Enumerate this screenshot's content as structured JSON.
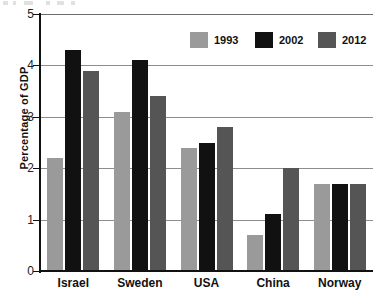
{
  "chart_data": {
    "type": "bar",
    "title": "",
    "subtitle": "",
    "xlabel": "",
    "ylabel": "Percentage of GDP",
    "categories": [
      "Israel",
      "Sweden",
      "USA",
      "China",
      "Norway"
    ],
    "series": [
      {
        "name": "1993",
        "color": "#9a9a9a",
        "values": [
          2.2,
          3.1,
          2.4,
          0.7,
          1.7
        ]
      },
      {
        "name": "2002",
        "color": "#111111",
        "values": [
          4.3,
          4.1,
          2.5,
          1.1,
          1.7
        ]
      },
      {
        "name": "2012",
        "color": "#555555",
        "values": [
          3.9,
          3.4,
          2.8,
          2.0,
          1.7
        ]
      }
    ],
    "ylim": [
      0,
      5
    ],
    "ytick_labels": [
      "0",
      "1",
      "2",
      "3",
      "4",
      "5"
    ],
    "ytick_values": [
      0,
      1,
      2,
      3,
      4,
      5
    ],
    "grid": true,
    "grid_axis": "y",
    "legend_position": "top-right",
    "orientation": "vertical",
    "grouping": "grouped"
  },
  "legend": {
    "entries": [
      {
        "label": "1993",
        "color": "#9a9a9a"
      },
      {
        "label": "2002",
        "color": "#111111"
      },
      {
        "label": "2012",
        "color": "#555555"
      }
    ]
  },
  "axes": {
    "y_title": "Percentage of GDP",
    "y_ticks": [
      "0",
      "1",
      "2",
      "3",
      "4",
      "5"
    ],
    "x_categories": [
      "Israel",
      "Sweden",
      "USA",
      "China",
      "Norway"
    ]
  }
}
